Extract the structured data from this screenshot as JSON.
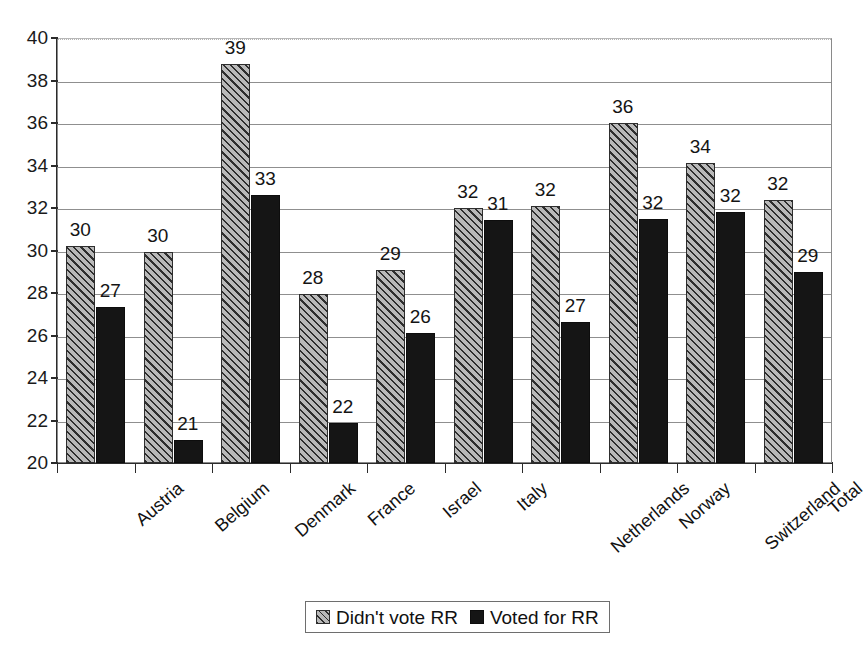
{
  "chart_data": {
    "type": "bar",
    "title": "",
    "subtitle": "",
    "xlabel": "",
    "ylabel": "",
    "ylim": [
      20,
      40
    ],
    "ytick_step": 2,
    "yticks": [
      "20",
      "22",
      "24",
      "26",
      "28",
      "30",
      "32",
      "34",
      "36",
      "38",
      "40"
    ],
    "grid": true,
    "legend_position": "bottom",
    "categories": [
      "Austria",
      "Belgium",
      "Denmark",
      "France",
      "Israel",
      "Italy",
      "Netherlands",
      "Norway",
      "Switzerland",
      "Total"
    ],
    "series": [
      {
        "name": "Didn't vote RR",
        "pattern": "diagonal-hatch",
        "color": "#b9b9b9",
        "values": [
          30.2,
          29.95,
          38.8,
          27.95,
          29.1,
          32.0,
          32.1,
          36.0,
          34.1,
          32.4
        ],
        "labels": [
          "30",
          "30",
          "39",
          "28",
          "29",
          "32",
          "32",
          "36",
          "34",
          "32"
        ]
      },
      {
        "name": "Voted for RR",
        "pattern": "solid",
        "color": "#151515",
        "values": [
          27.35,
          21.1,
          32.6,
          21.9,
          26.1,
          31.45,
          26.65,
          31.5,
          31.8,
          29.0
        ],
        "labels": [
          "27",
          "21",
          "33",
          "22",
          "26",
          "31",
          "27",
          "32",
          "32",
          "29"
        ]
      }
    ]
  },
  "legend": {
    "entries": [
      {
        "label": "Didn't vote RR"
      },
      {
        "label": "Voted for RR"
      }
    ]
  }
}
